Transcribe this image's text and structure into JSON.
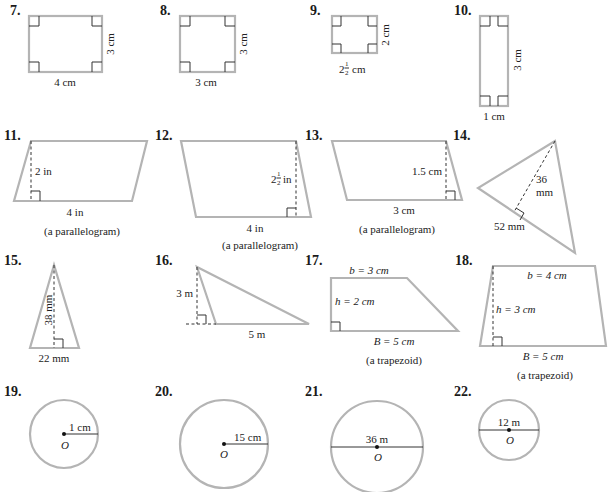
{
  "problems": {
    "p7": {
      "number": "7.",
      "width": "4 cm",
      "height": "3 cm"
    },
    "p8": {
      "number": "8.",
      "width": "3 cm",
      "height": "3 cm"
    },
    "p9": {
      "number": "9.",
      "width_whole": "2",
      "width_num": "1",
      "width_den": "2",
      "width_unit": "cm",
      "height": "2 cm"
    },
    "p10": {
      "number": "10.",
      "width": "1 cm",
      "height": "3 cm"
    },
    "p11": {
      "number": "11.",
      "base": "4 in",
      "height": "2 in",
      "caption": "(a parallelogram)"
    },
    "p12": {
      "number": "12.",
      "base": "4 in",
      "height_whole": "2",
      "height_num": "1",
      "height_den": "2",
      "height_unit": "in",
      "caption": "(a parallelogram)"
    },
    "p13": {
      "number": "13.",
      "base": "3 cm",
      "height": "1.5 cm",
      "caption": "(a parallelogram)"
    },
    "p14": {
      "number": "14.",
      "base": "52 mm",
      "height_line1": "36",
      "height_line2": "mm"
    },
    "p15": {
      "number": "15.",
      "base": "22 mm",
      "height": "38 mm"
    },
    "p16": {
      "number": "16.",
      "base": "5 m",
      "height": "3 m"
    },
    "p17": {
      "number": "17.",
      "b": "b = 3 cm",
      "h": "h = 2 cm",
      "B": "B = 5 cm",
      "caption": "(a trapezoid)"
    },
    "p18": {
      "number": "18.",
      "b": "b = 4 cm",
      "h": "h = 3 cm",
      "B": "B = 5 cm",
      "caption": "(a trapezoid)"
    },
    "p19": {
      "number": "19.",
      "radius": "1 cm",
      "center": "O"
    },
    "p20": {
      "number": "20.",
      "radius": "15 cm",
      "center": "O"
    },
    "p21": {
      "number": "21.",
      "diameter": "36 m",
      "center": "O"
    },
    "p22": {
      "number": "22.",
      "diameter": "12 m",
      "center": "O"
    }
  },
  "colors": {
    "shape_stroke": "#b4b4b4",
    "annotation": "#333333",
    "text": "#222222"
  }
}
